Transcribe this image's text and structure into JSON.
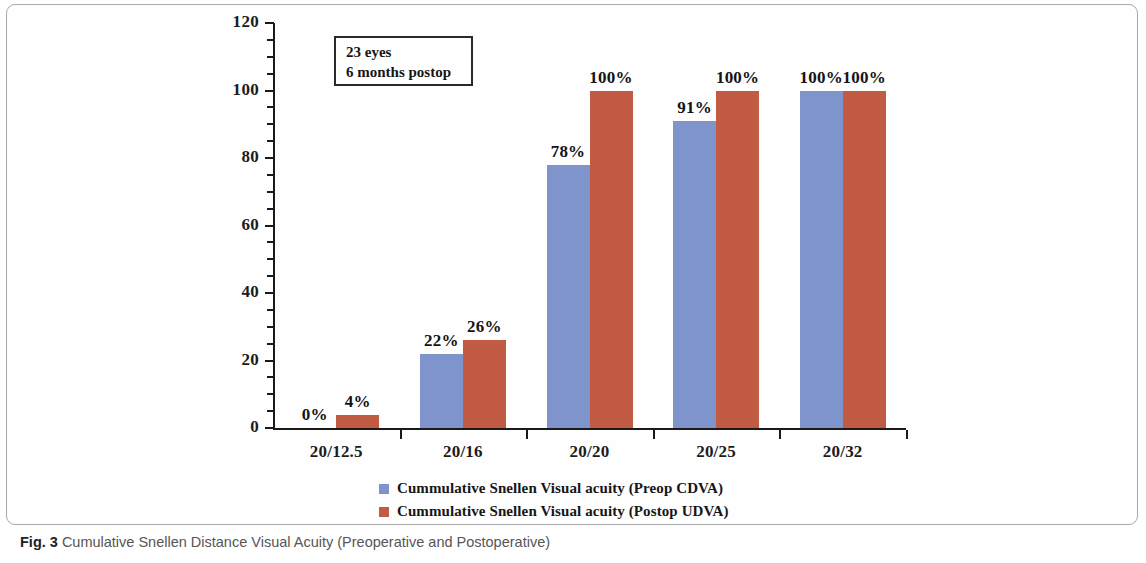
{
  "caption": {
    "label": "Fig. 3",
    "text": "Cumulative Snellen Distance Visual Acuity (Preoperative and Postoperative)"
  },
  "annotation": {
    "line1": "23 eyes",
    "line2": "6 months  postop"
  },
  "colors": {
    "series_a": "#8094cc",
    "series_b": "#c15b43",
    "axis": "#1a1a1a",
    "frame_border": "#a8a8a8"
  },
  "chart_data": {
    "type": "bar",
    "title": "",
    "xlabel": "",
    "ylabel": "",
    "ylim": [
      0,
      120
    ],
    "yticks": [
      0,
      20,
      40,
      60,
      80,
      100,
      120
    ],
    "ytick_labels": [
      "0",
      "20",
      "40",
      "60",
      "80",
      "100",
      "120"
    ],
    "grid": false,
    "legend_position": "bottom",
    "categories": [
      "20/12.5",
      "20/16",
      "20/20",
      "20/25",
      "20/32"
    ],
    "series": [
      {
        "name": "Cummulative Snellen Visual acuity (Preop CDVA)",
        "color": "#8094cc",
        "values": [
          0,
          22,
          78,
          91,
          100
        ],
        "labels": [
          "0%",
          "22%",
          "78%",
          "91%",
          "100%"
        ]
      },
      {
        "name": "Cummulative Snellen Visual acuity (Postop UDVA)",
        "color": "#c15b43",
        "values": [
          4,
          26,
          100,
          100,
          100
        ],
        "labels": [
          "4%",
          "26%",
          "100%",
          "100%",
          "100%"
        ]
      }
    ]
  }
}
